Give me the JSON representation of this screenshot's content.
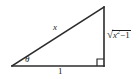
{
  "figure": {
    "type": "right-triangle-diagram",
    "background_color": "#ffffff",
    "stroke_color": "#2b2b2b",
    "text_color": "#1c1c1c"
  },
  "geometry": {
    "vertices": {
      "left": {
        "x": 12,
        "y": 66
      },
      "bottom_right": {
        "x": 104,
        "y": 66
      },
      "apex": {
        "x": 104,
        "y": 7
      }
    },
    "right_angle_marker": {
      "vertex": "bottom_right",
      "size": 7
    },
    "angle_arc": {
      "vertex": "left",
      "radius": 16
    }
  },
  "labels": {
    "hypotenuse": "x",
    "base": "1",
    "angle": "θ",
    "opposite": {
      "surd": "√",
      "variable": "x",
      "exponent": "2",
      "operator": "−",
      "constant": "1"
    }
  }
}
